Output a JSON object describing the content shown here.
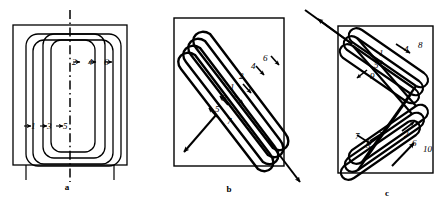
{
  "figure": {
    "panels": [
      {
        "id": "a",
        "label": "a",
        "kind": "concentric-rectangular-winding",
        "description": "Nested rounded-rectangular concentric coils inside an outer rectangular core window, with a vertical dash-dot centre line",
        "left_numbers": [
          "1",
          "3",
          "5"
        ],
        "top_numbers": [
          "2",
          "4",
          "6"
        ],
        "centerline": "dash-dot"
      },
      {
        "id": "b",
        "label": "b",
        "kind": "diagonal-helical-winding",
        "description": "Single continuous diagonal helical winding wrapped around a rectangular core, entering top-left and exiting bottom-right",
        "numbers": [
          "1",
          "2",
          "3",
          "4",
          "5",
          "6",
          "7"
        ]
      },
      {
        "id": "c",
        "label": "c",
        "kind": "crossed-bifilar-winding",
        "description": "Two interleaved crossed diagonal windings on a rectangular core with lead-in at upper-left and lead-out at lower-right",
        "numbers": [
          "1",
          "2",
          "3",
          "4",
          "5",
          "6",
          "7",
          "8",
          "9",
          "10"
        ]
      }
    ],
    "caption": ""
  },
  "colors": {
    "stroke": "#000000",
    "background": "#ffffff",
    "caption": "#bfbfbf"
  }
}
